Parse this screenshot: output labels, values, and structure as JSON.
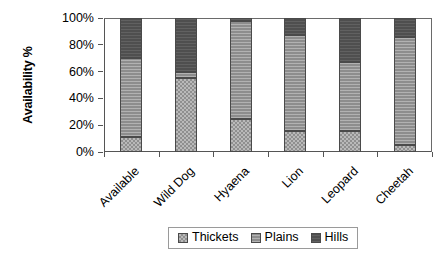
{
  "chart_data": {
    "type": "bar",
    "subtype": "stacked-100-percent",
    "title": "",
    "xlabel": "",
    "ylabel": "Availability %",
    "ylim": [
      0,
      100
    ],
    "yticks": [
      "0%",
      "20%",
      "40%",
      "60%",
      "80%",
      "100%"
    ],
    "ytick_values": [
      0,
      20,
      40,
      60,
      80,
      100
    ],
    "grid": false,
    "legend_position": "bottom",
    "categories": [
      "Available",
      "Wild Dog",
      "Hyaena",
      "Lion",
      "Leopard",
      "Cheetah"
    ],
    "series": [
      {
        "name": "Thickets",
        "color": "#b9b9b9",
        "pattern": "checker",
        "values": [
          11,
          55,
          25,
          16,
          16,
          5
        ]
      },
      {
        "name": "Plains",
        "color": "#8d8d8d",
        "pattern": "fine-horizontal-lines",
        "values": [
          59,
          5,
          73,
          71,
          51,
          81
        ]
      },
      {
        "name": "Hills",
        "color": "#4f4f4f",
        "pattern": "solid-dark",
        "values": [
          30,
          40,
          2,
          13,
          33,
          14
        ]
      }
    ],
    "cumulative_tops": {
      "Available": {
        "thickets": 11,
        "plains": 70,
        "hills": 100
      },
      "Wild Dog": {
        "thickets": 55,
        "plains": 60,
        "hills": 100
      },
      "Hyaena": {
        "thickets": 25,
        "plains": 98,
        "hills": 100
      },
      "Lion": {
        "thickets": 16,
        "plains": 87,
        "hills": 100
      },
      "Leopard": {
        "thickets": 16,
        "plains": 67,
        "hills": 100
      },
      "Cheetah": {
        "thickets": 5,
        "plains": 86,
        "hills": 100
      }
    }
  },
  "legend": {
    "items": [
      {
        "label": "Thickets"
      },
      {
        "label": "Plains"
      },
      {
        "label": "Hills"
      }
    ]
  }
}
